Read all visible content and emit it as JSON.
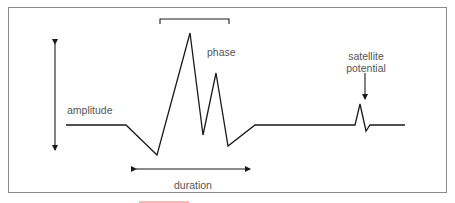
{
  "diagram": {
    "title": "",
    "labels": {
      "amplitude": "amplitude",
      "phase": "phase",
      "duration": "duration",
      "satellite_line1": "satellite",
      "satellite_line2": "potential"
    },
    "colors": {
      "stroke": "#1a1a1a",
      "frame": "#8a8a8a",
      "text": "#555555",
      "accent_bar": "#f4b9b9"
    },
    "waveform_points": "66,125 126,125 157,155 190,33 203,135 216,73 228,146 255,125 355,125 360,104 366,131 370,125 405,125",
    "annotations": {
      "amplitude_arrow": {
        "x": 55,
        "y_top": 38,
        "y_bottom": 155
      },
      "duration_arrow": {
        "y": 169,
        "x_left": 130,
        "x_right": 256
      },
      "phase_bracket": {
        "y": 19,
        "x_left": 160,
        "x_right": 229,
        "tick": 5
      },
      "satellite_arrow": {
        "x": 365,
        "y_top": 73,
        "y_bottom": 100
      }
    }
  }
}
